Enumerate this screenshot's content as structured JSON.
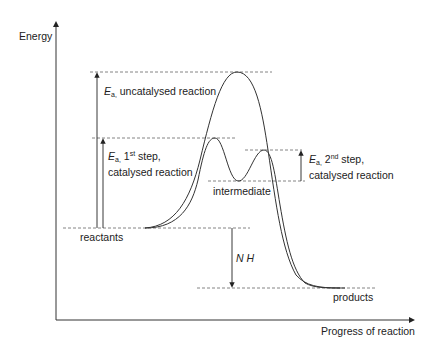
{
  "diagram": {
    "type": "reaction energy profile",
    "axes": {
      "y_label": "Energy",
      "x_label": "Progress of reaction"
    },
    "levels": {
      "reactants": "reactants",
      "products": "products",
      "intermediate": "intermediate"
    },
    "annotations": {
      "ea_symbol": "E",
      "ea_subscript": "a,",
      "ea_uncatalysed": "uncatalysed reaction",
      "ea_first_step_num": "1",
      "ea_first_step_sup": "st",
      "ea_first_step_suffix": "step,",
      "ea_first_step_line2": "catalysed reaction",
      "ea_second_step_num": "2",
      "ea_second_step_sup": "nd",
      "ea_second_step_suffix": "step,",
      "ea_second_step_line2": "catalysed reaction",
      "delta_h": "N H"
    },
    "curves": [
      {
        "name": "uncatalysed",
        "description": "single high peak"
      },
      {
        "name": "catalysed",
        "description": "two lower peaks with intermediate minimum"
      }
    ],
    "colors": {
      "line": "#333333",
      "dashed": "#555555"
    }
  }
}
